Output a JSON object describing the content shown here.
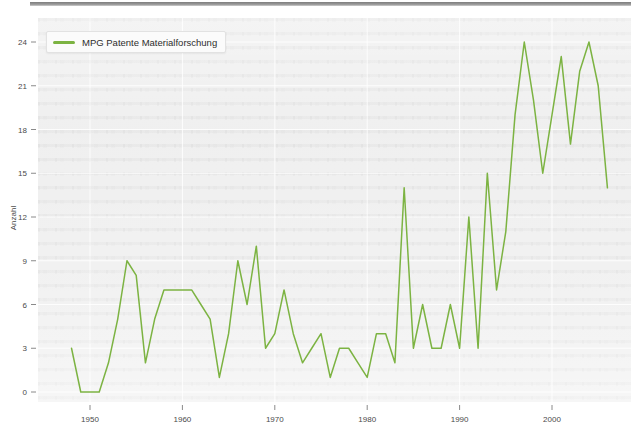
{
  "legend": {
    "label": "MPG Patente Materialforschung",
    "color": "#7cb342"
  },
  "axes": {
    "y_title": "Anzahl",
    "y_ticks": [
      "0",
      "3",
      "6",
      "9",
      "12",
      "15",
      "18",
      "21",
      "24"
    ],
    "x_ticks": [
      "1950",
      "1960",
      "1970",
      "1980",
      "1990",
      "2000"
    ]
  },
  "chart_data": {
    "type": "line",
    "title": "",
    "xlabel": "",
    "ylabel": "Anzahl",
    "xlim": [
      1947,
      2007
    ],
    "ylim": [
      0,
      25
    ],
    "grid": true,
    "legend_position": "top-left",
    "legend_entries": [
      "MPG Patente Materialforschung"
    ],
    "line_color": "#7cb342",
    "x": [
      1948,
      1949,
      1950,
      1951,
      1952,
      1953,
      1954,
      1955,
      1956,
      1957,
      1958,
      1959,
      1960,
      1961,
      1962,
      1963,
      1964,
      1965,
      1966,
      1967,
      1968,
      1969,
      1970,
      1971,
      1972,
      1973,
      1974,
      1975,
      1976,
      1977,
      1978,
      1979,
      1980,
      1981,
      1982,
      1983,
      1984,
      1985,
      1986,
      1987,
      1988,
      1989,
      1990,
      1991,
      1992,
      1993,
      1994,
      1995,
      1996,
      1997,
      1998,
      1999,
      2000,
      2001,
      2002,
      2003,
      2004,
      2005,
      2006
    ],
    "series": [
      {
        "name": "MPG Patente Materialforschung",
        "values": [
          3,
          0,
          0,
          0,
          2,
          5,
          9,
          8,
          2,
          5,
          7,
          7,
          7,
          7,
          6,
          5,
          1,
          4,
          9,
          6,
          10,
          3,
          4,
          7,
          4,
          2,
          3,
          4,
          1,
          3,
          3,
          2,
          1,
          4,
          4,
          2,
          14,
          3,
          6,
          3,
          3,
          6,
          3,
          12,
          3,
          15,
          7,
          11,
          19,
          24,
          20,
          15,
          19,
          23,
          17,
          22,
          24,
          21,
          14
        ]
      }
    ]
  }
}
